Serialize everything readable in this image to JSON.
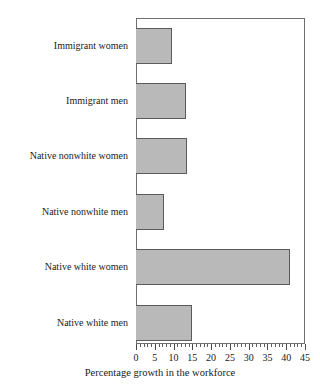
{
  "chart_data": {
    "type": "bar",
    "orientation": "horizontal",
    "title": "",
    "xlabel": "Percentage growth in the workforce",
    "ylabel": "",
    "categories": [
      "Immigrant women",
      "Immigrant men",
      "Native nonwhite women",
      "Native nonwhite men",
      "Native white women",
      "Native white men"
    ],
    "values": [
      9.6,
      13.3,
      13.6,
      7.4,
      41.0,
      15.0
    ],
    "xlim": [
      0,
      45
    ],
    "xticks": [
      0,
      5,
      10,
      15,
      20,
      25,
      30,
      35,
      40,
      45
    ],
    "xtick_labels": [
      "0",
      "5",
      "10",
      "15",
      "20",
      "25",
      "30",
      "35",
      "40",
      "45"
    ],
    "minor_tick_step": 1,
    "grid": false,
    "legend": null,
    "bar_fill_color": "#b9b9b9",
    "bar_edge_color": "#5b5b5b",
    "frame_color": "#6f6f6f",
    "background_color": "#ffffff"
  }
}
